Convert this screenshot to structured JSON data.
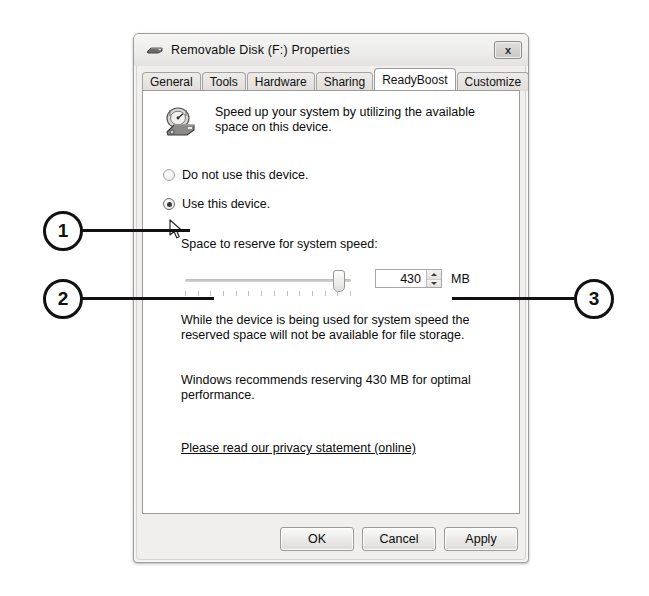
{
  "window": {
    "title": "Removable Disk (F:) Properties",
    "title_icon": "removable-disk-icon",
    "close_label": "x"
  },
  "tabs": [
    {
      "label": "General",
      "active": false
    },
    {
      "label": "Tools",
      "active": false
    },
    {
      "label": "Hardware",
      "active": false
    },
    {
      "label": "Sharing",
      "active": false
    },
    {
      "label": "ReadyBoost",
      "active": true
    },
    {
      "label": "Customize",
      "active": false
    }
  ],
  "page": {
    "icon": "readyboost-speed-icon",
    "description": "Speed up your system by utilizing the available space on this device.",
    "radios": [
      {
        "label": "Do not use this device.",
        "checked": false
      },
      {
        "label": "Use this device.",
        "checked": true
      }
    ],
    "space_label": "Space to reserve for system speed:",
    "slider": {
      "value": 430,
      "min": 0,
      "max": 470,
      "tick_count": 14,
      "thumb_percent": 91
    },
    "spinner": {
      "value": "430",
      "unit": "MB",
      "up_arrow": "spin-up-icon",
      "down_arrow": "spin-down-icon"
    },
    "paragraph_1": "While the device is being used for system speed the reserved space will not be available for file storage.",
    "paragraph_2": "Windows recommends reserving 430 MB for optimal performance.",
    "privacy_link": "Please read our privacy statement (online)"
  },
  "buttons": {
    "ok": "OK",
    "cancel": "Cancel",
    "apply": "Apply"
  },
  "callouts": [
    {
      "number": "1"
    },
    {
      "number": "2"
    },
    {
      "number": "3"
    }
  ],
  "colors": {
    "window_bg": "#f0efee",
    "page_bg": "#ffffff",
    "text": "#0a0a0a",
    "callout": "#111111"
  }
}
